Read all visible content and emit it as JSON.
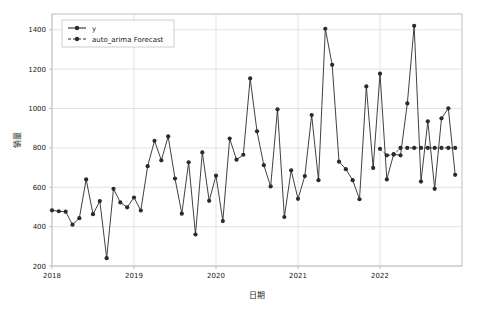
{
  "chart_data": {
    "type": "line",
    "title": "",
    "xlabel": "日期",
    "ylabel": "销量",
    "ylim": [
      200,
      1480
    ],
    "xlim": [
      "2018-01",
      "2023-01"
    ],
    "yticks": [
      200,
      400,
      600,
      800,
      1000,
      1200,
      1400
    ],
    "ytick_labels": [
      "200",
      "400",
      "600",
      "800",
      "1000",
      "1200",
      "1400"
    ],
    "xticks": [
      "2018",
      "2019",
      "2020",
      "2021",
      "2022"
    ],
    "xtick_labels": [
      "2018",
      "2019",
      "2020",
      "2021",
      "2022"
    ],
    "grid": true,
    "legend_position": "upper left",
    "marker": "circle",
    "series": [
      {
        "name": "y",
        "color": "#2b2b2b",
        "linestyle": "solid",
        "x": [
          "2018-01",
          "2018-02",
          "2018-03",
          "2018-04",
          "2018-05",
          "2018-06",
          "2018-07",
          "2018-08",
          "2018-09",
          "2018-10",
          "2018-11",
          "2018-12",
          "2019-01",
          "2019-02",
          "2019-03",
          "2019-04",
          "2019-05",
          "2019-06",
          "2019-07",
          "2019-08",
          "2019-09",
          "2019-10",
          "2019-11",
          "2019-12",
          "2020-01",
          "2020-02",
          "2020-03",
          "2020-04",
          "2020-05",
          "2020-06",
          "2020-07",
          "2020-08",
          "2020-09",
          "2020-10",
          "2020-11",
          "2020-12",
          "2021-01",
          "2021-02",
          "2021-03",
          "2021-04",
          "2021-05",
          "2021-06",
          "2021-07",
          "2021-08",
          "2021-09",
          "2021-10",
          "2021-11",
          "2021-12",
          "2022-01",
          "2022-02",
          "2022-03",
          "2022-04",
          "2022-05",
          "2022-06",
          "2022-07",
          "2022-08",
          "2022-09",
          "2022-10",
          "2022-11",
          "2022-12"
        ],
        "values": [
          483,
          478,
          476,
          410,
          443,
          640,
          463,
          530,
          240,
          592,
          523,
          498,
          548,
          482,
          707,
          836,
          737,
          858,
          644,
          466,
          727,
          360,
          777,
          531,
          659,
          428,
          847,
          740,
          765,
          1153,
          884,
          712,
          604,
          996,
          449,
          686,
          541,
          657,
          967,
          636,
          1405,
          1222,
          730,
          692,
          636,
          539,
          1112,
          698,
          1177,
          640,
          768,
          762,
          1026,
          1420,
          629,
          935,
          592,
          950,
          1001,
          663
        ]
      },
      {
        "name": "auto_arima Forecast",
        "color": "#2b2b2b",
        "linestyle": "dashed",
        "x": [
          "2022-01",
          "2022-02",
          "2022-03",
          "2022-04",
          "2022-05",
          "2022-06",
          "2022-07",
          "2022-08",
          "2022-09",
          "2022-10",
          "2022-11",
          "2022-12"
        ],
        "values": [
          795,
          762,
          766,
          800,
          800,
          800,
          800,
          800,
          800,
          800,
          800,
          800
        ]
      }
    ]
  },
  "legend": {
    "entries": [
      {
        "label": "y",
        "style": "solid"
      },
      {
        "label": "auto_arima Forecast",
        "style": "dashed"
      }
    ]
  },
  "colors": {
    "background": "#ffffff",
    "line": "#2b2b2b",
    "grid": "#dcdcdc",
    "frame": "#b8b8b8",
    "text": "#1a1a1a"
  }
}
